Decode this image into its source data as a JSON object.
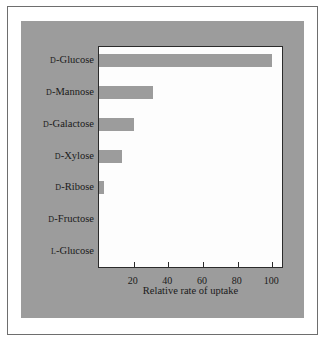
{
  "chart_data": {
    "type": "bar",
    "orientation": "horizontal",
    "title": "",
    "xlabel": "Relative rate of uptake",
    "ylabel": "",
    "xlim": [
      0,
      105
    ],
    "xticks": [
      20,
      40,
      60,
      80,
      100
    ],
    "grid": false,
    "legend": null,
    "categories": [
      "D-Glucose",
      "D-Mannose",
      "D-Galactose",
      "D-Xylose",
      "D-Ribose",
      "D-Fructose",
      "L-Glucose"
    ],
    "category_parts": [
      {
        "prefix": "D",
        "name": "-Glucose"
      },
      {
        "prefix": "D",
        "name": "-Mannose"
      },
      {
        "prefix": "D",
        "name": "-Galactose"
      },
      {
        "prefix": "D",
        "name": "-Xylose"
      },
      {
        "prefix": "D",
        "name": "-Ribose"
      },
      {
        "prefix": "D",
        "name": "-Fructose"
      },
      {
        "prefix": "L",
        "name": "-Glucose"
      }
    ],
    "values": [
      100,
      31,
      20,
      13,
      3,
      0,
      0
    ],
    "colors": {
      "bar": "#9c9c9c",
      "panel": "#9c9c9c",
      "plot_background": "#fdfdfd",
      "axis": "#2b2b2b",
      "text": "#1a1a1a",
      "figure_border": "#6e6e6e",
      "figure_background": "#ffffff"
    }
  }
}
